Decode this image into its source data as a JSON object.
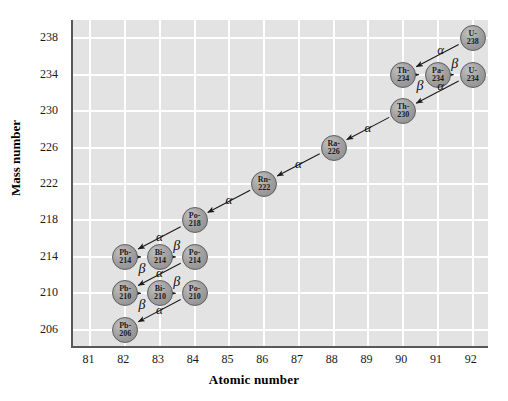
{
  "axes": {
    "x_title": "Atomic number",
    "y_title": "Mass number",
    "x_ticks": [
      "81",
      "82",
      "83",
      "84",
      "85",
      "86",
      "87",
      "88",
      "89",
      "90",
      "91",
      "92"
    ],
    "y_ticks": [
      "238",
      "234",
      "230",
      "226",
      "222",
      "218",
      "214",
      "210",
      "206"
    ]
  },
  "chart_data": {
    "type": "scatter",
    "title": "",
    "xlabel": "Atomic number",
    "ylabel": "Mass number",
    "xlim": [
      80.5,
      92.5
    ],
    "ylim": [
      204,
      240
    ],
    "grid": true,
    "legend": "none",
    "nodes": [
      {
        "id": "U-238",
        "element": "U-",
        "mass": "238",
        "z": 92,
        "a": 238
      },
      {
        "id": "Th-234",
        "element": "Th-",
        "mass": "234",
        "z": 90,
        "a": 234
      },
      {
        "id": "Pa-234",
        "element": "Pa-",
        "mass": "234",
        "z": 91,
        "a": 234
      },
      {
        "id": "U-234",
        "element": "U-",
        "mass": "234",
        "z": 92,
        "a": 234
      },
      {
        "id": "Th-230",
        "element": "Th-",
        "mass": "230",
        "z": 90,
        "a": 230
      },
      {
        "id": "Ra-226",
        "element": "Ra-",
        "mass": "226",
        "z": 88,
        "a": 226
      },
      {
        "id": "Rn-222",
        "element": "Rn-",
        "mass": "222",
        "z": 86,
        "a": 222
      },
      {
        "id": "Po-218",
        "element": "Po-",
        "mass": "218",
        "z": 84,
        "a": 218
      },
      {
        "id": "Pb-214",
        "element": "Pb-",
        "mass": "214",
        "z": 82,
        "a": 214
      },
      {
        "id": "Bi-214",
        "element": "Bi-",
        "mass": "214",
        "z": 83,
        "a": 214
      },
      {
        "id": "Po-214",
        "element": "Po-",
        "mass": "214",
        "z": 84,
        "a": 214
      },
      {
        "id": "Pb-210",
        "element": "Pb-",
        "mass": "210",
        "z": 82,
        "a": 210
      },
      {
        "id": "Bi-210",
        "element": "Bi-",
        "mass": "210",
        "z": 83,
        "a": 210
      },
      {
        "id": "Po-210",
        "element": "Po-",
        "mass": "210",
        "z": 84,
        "a": 210
      },
      {
        "id": "Pb-206",
        "element": "Pb-",
        "mass": "206",
        "z": 82,
        "a": 206
      }
    ],
    "decays": [
      {
        "from": "U-238",
        "to": "Th-234",
        "mode": "α",
        "label_z": 91.1,
        "label_a": 236.6
      },
      {
        "from": "Th-234",
        "to": "Pa-234",
        "mode": "β",
        "label_z": 90.5,
        "label_a": 232.6
      },
      {
        "from": "Pa-234",
        "to": "U-234",
        "mode": "β",
        "label_z": 91.5,
        "label_a": 235.1
      },
      {
        "from": "U-234",
        "to": "Th-230",
        "mode": "α",
        "label_z": 91.1,
        "label_a": 232.6
      },
      {
        "from": "Th-230",
        "to": "Ra-226",
        "mode": "α",
        "label_z": 89.0,
        "label_a": 228.0
      },
      {
        "from": "Ra-226",
        "to": "Rn-222",
        "mode": "α",
        "label_z": 87.0,
        "label_a": 224.1
      },
      {
        "from": "Rn-222",
        "to": "Po-218",
        "mode": "α",
        "label_z": 85.0,
        "label_a": 220.1
      },
      {
        "from": "Po-218",
        "to": "Pb-214",
        "mode": "α",
        "label_z": 83.0,
        "label_a": 216.1
      },
      {
        "from": "Pb-214",
        "to": "Bi-214",
        "mode": "β",
        "label_z": 82.5,
        "label_a": 212.6
      },
      {
        "from": "Bi-214",
        "to": "Po-214",
        "mode": "β",
        "label_z": 83.5,
        "label_a": 215.1
      },
      {
        "from": "Po-214",
        "to": "Pb-210",
        "mode": "α",
        "label_z": 83.0,
        "label_a": 212.1
      },
      {
        "from": "Pb-210",
        "to": "Bi-210",
        "mode": "β",
        "label_z": 82.5,
        "label_a": 208.6
      },
      {
        "from": "Bi-210",
        "to": "Po-210",
        "mode": "β",
        "label_z": 83.5,
        "label_a": 211.1
      },
      {
        "from": "Po-210",
        "to": "Pb-206",
        "mode": "α",
        "label_z": 83.0,
        "label_a": 208.1
      }
    ],
    "colors": {
      "plot_background": "#e3e3e3",
      "gridline": "#ffffff",
      "node_fill": "#a2a2a2",
      "node_border": "#5d5d5f",
      "arrow": "#1a1a1a",
      "axis": "#58585a",
      "text": "#1a1a1a"
    }
  }
}
